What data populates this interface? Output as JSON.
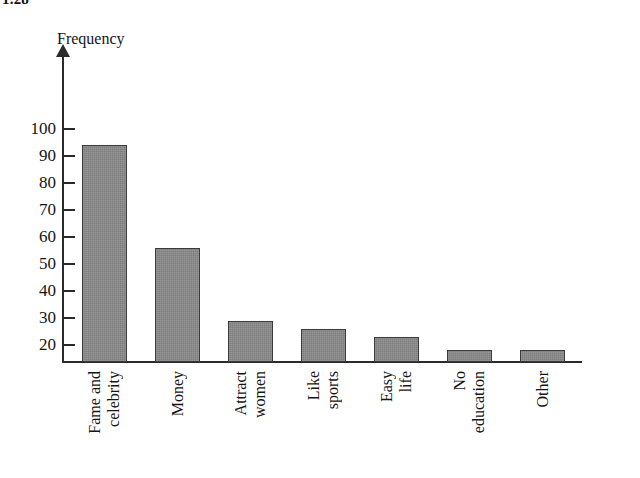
{
  "exercise": {
    "number": "1.28"
  },
  "chart_data": {
    "type": "bar",
    "title": "",
    "ylabel": "Frequency",
    "xlabel": "",
    "categories": [
      "Fame and celebrity",
      "Money",
      "Attract women",
      "Like sports",
      "Easy life",
      "No education",
      "Other"
    ],
    "category_lines": [
      [
        "Fame and",
        "celebrity"
      ],
      [
        "Money"
      ],
      [
        "Attract",
        "women"
      ],
      [
        "Like",
        "sports"
      ],
      [
        "Easy",
        "life"
      ],
      [
        "No",
        "education"
      ],
      [
        "Other"
      ]
    ],
    "values": [
      94,
      56,
      29,
      26,
      23,
      18,
      18
    ],
    "ylim": [
      15,
      104
    ],
    "yticks": [
      20,
      30,
      40,
      50,
      60,
      70,
      80,
      90,
      100
    ],
    "ytick_labels": [
      "20",
      "30",
      "40",
      "50",
      "60",
      "70",
      "80",
      "90",
      "100"
    ],
    "grid": false,
    "legend": null,
    "bar_color": "#7d7d7d",
    "bar_border_color": "#3a3a3a",
    "axis_color": "#2b2b2b"
  }
}
